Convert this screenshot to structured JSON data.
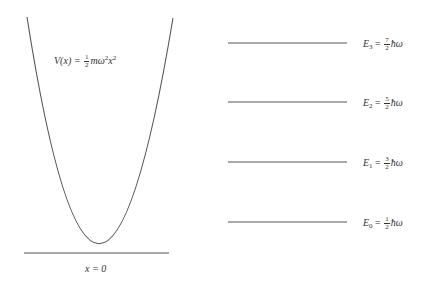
{
  "potential": {
    "lhs": "V(x) =",
    "frac_num": "1",
    "frac_den": "2",
    "rhs_m": "mω",
    "rhs_exp1": "2",
    "rhs_x": "x",
    "rhs_exp2": "2"
  },
  "origin_label": "x = 0",
  "levels": [
    {
      "symbol": "E",
      "index": "3",
      "eq": "=",
      "num": "7",
      "den": "2",
      "unit": "ħω"
    },
    {
      "symbol": "E",
      "index": "2",
      "eq": "=",
      "num": "5",
      "den": "2",
      "unit": "ħω"
    },
    {
      "symbol": "E",
      "index": "1",
      "eq": "=",
      "num": "3",
      "den": "2",
      "unit": "ħω"
    },
    {
      "symbol": "E",
      "index": "0",
      "eq": "=",
      "num": "1",
      "den": "2",
      "unit": "ħω"
    }
  ],
  "colors": {
    "stroke": "#555555",
    "text": "#333333"
  }
}
